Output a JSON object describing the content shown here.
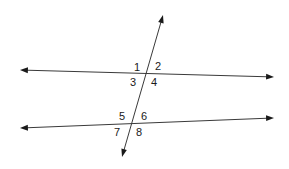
{
  "diagram": {
    "colors": {
      "line": "#3a3a3a",
      "arrowhead": "#1a1a1a",
      "label": "#1a1a1a",
      "background": "#ffffff"
    },
    "lines": [
      {
        "id": "upper-line",
        "x1": 20,
        "y1": 70,
        "x2": 274,
        "y2": 77
      },
      {
        "id": "lower-line",
        "x1": 20,
        "y1": 128,
        "x2": 274,
        "y2": 118
      },
      {
        "id": "transversal",
        "x1": 163,
        "y1": 15,
        "x2": 122,
        "y2": 157
      }
    ],
    "angle_labels": [
      {
        "text": "1",
        "x": 134,
        "y": 71
      },
      {
        "text": "2",
        "x": 155,
        "y": 70
      },
      {
        "text": "3",
        "x": 130,
        "y": 86
      },
      {
        "text": "4",
        "x": 151,
        "y": 86
      },
      {
        "text": "5",
        "x": 119,
        "y": 120
      },
      {
        "text": "6",
        "x": 141,
        "y": 120
      },
      {
        "text": "7",
        "x": 114,
        "y": 136
      },
      {
        "text": "8",
        "x": 136,
        "y": 136
      }
    ]
  }
}
